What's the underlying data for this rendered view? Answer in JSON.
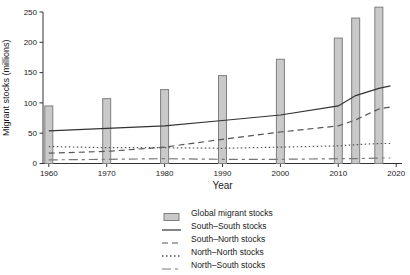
{
  "chart_data": {
    "type": "bar",
    "title": "",
    "xlabel": "Year",
    "ylabel": "Migrant stocks (millions)",
    "xlim": [
      1959,
      2021
    ],
    "ylim": [
      0,
      250
    ],
    "x_ticks": [
      1960,
      1970,
      1980,
      1990,
      2000,
      2010,
      2020
    ],
    "y_ticks": [
      0,
      50,
      100,
      150,
      200,
      250
    ],
    "grid": false,
    "legend_position": "bottom",
    "axis_color": "#333333",
    "bar_series": {
      "name": "Global migrant stocks",
      "fill": "#c9c9c9",
      "stroke": "#7f7f7f",
      "years": [
        1960,
        1970,
        1980,
        1990,
        2000,
        2010,
        2013,
        2017
      ],
      "values": [
        95,
        107,
        122,
        145,
        172,
        207,
        240,
        258
      ]
    },
    "line_series": [
      {
        "name": "South–South stocks",
        "style": "solid",
        "color": "#333333",
        "dash": "",
        "years": [
          1960,
          1970,
          1980,
          1990,
          2000,
          2010,
          2013,
          2017,
          2019
        ],
        "values": [
          54,
          58,
          62,
          71,
          80,
          95,
          112,
          124,
          128
        ]
      },
      {
        "name": "South–North stocks",
        "style": "dashed",
        "color": "#555555",
        "dash": "6,4",
        "years": [
          1960,
          1970,
          1980,
          1990,
          2000,
          2010,
          2013,
          2017,
          2019
        ],
        "values": [
          17,
          20,
          27,
          40,
          52,
          62,
          72,
          90,
          93
        ]
      },
      {
        "name": "North–North stocks",
        "style": "dotted",
        "color": "#555555",
        "dash": "1.5,2.5",
        "years": [
          1960,
          1970,
          1980,
          1990,
          2000,
          2010,
          2013,
          2017,
          2019
        ],
        "values": [
          28,
          26,
          26,
          25,
          27,
          29,
          31,
          33,
          33
        ]
      },
      {
        "name": "North–South stocks",
        "style": "twodash",
        "color": "#777777",
        "dash": "9,4,3,4",
        "years": [
          1960,
          1970,
          1980,
          1990,
          2000,
          2010,
          2013,
          2017,
          2019
        ],
        "values": [
          6,
          7,
          8,
          7,
          7,
          8,
          8,
          9,
          9
        ]
      }
    ]
  }
}
